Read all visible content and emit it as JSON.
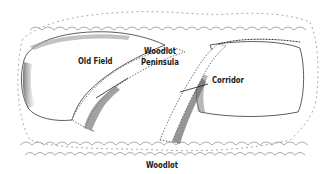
{
  "diagram": {
    "type": "landscape-illustration",
    "labels": {
      "old_field": "Old Field",
      "woodlot_peninsula_line1": "Woodlot",
      "woodlot_peninsula_line2": "Peninsula",
      "corridor": "Corridor",
      "woodlot": "Woodlot"
    },
    "colors": {
      "ink": "#1a1a1a",
      "shadow": "#8a8a8a",
      "background": "#ffffff"
    }
  }
}
